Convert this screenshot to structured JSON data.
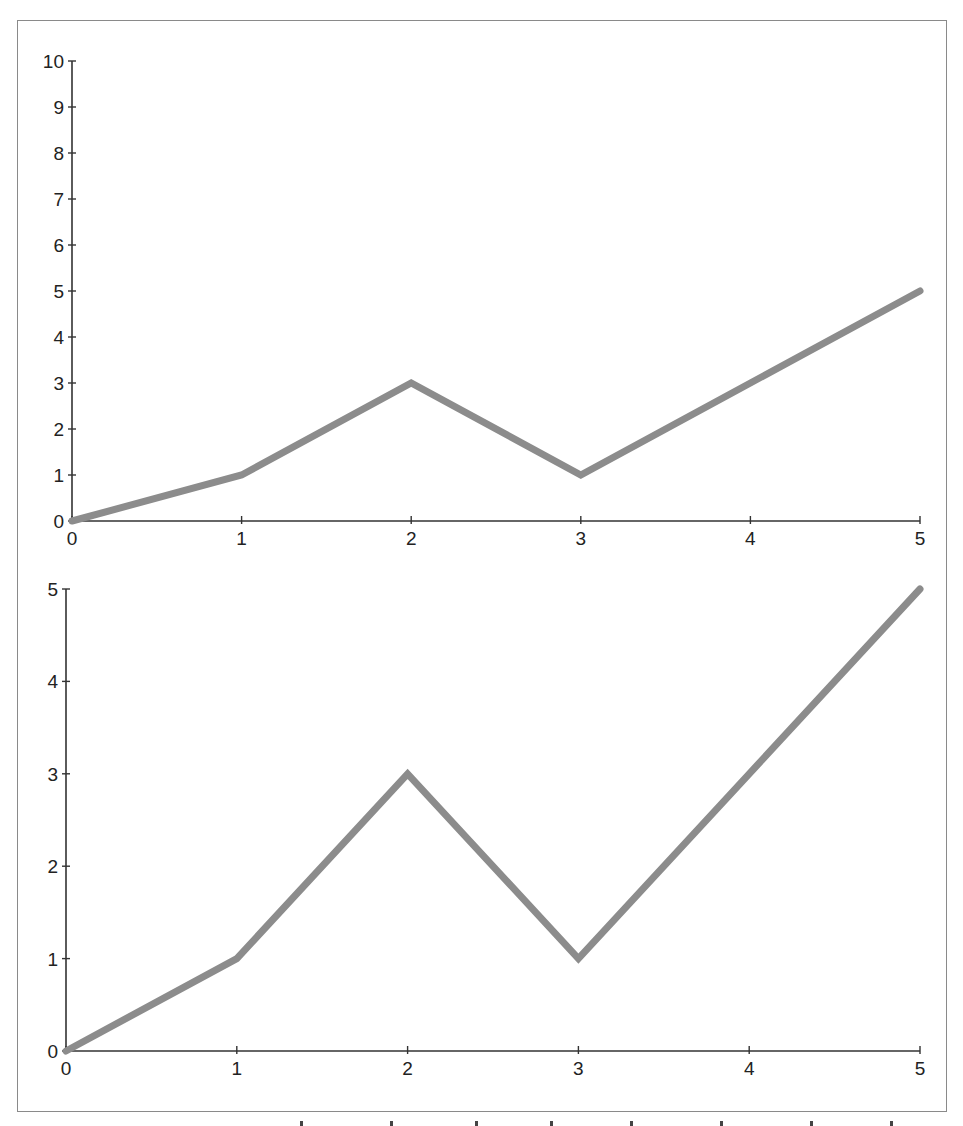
{
  "chart_data": [
    {
      "type": "line",
      "title": "",
      "xlabel": "",
      "ylabel": "",
      "x": [
        0,
        1,
        2,
        3,
        4,
        5
      ],
      "series": [
        {
          "name": "",
          "values": [
            0,
            1,
            3,
            1,
            3,
            5
          ]
        }
      ],
      "xlim": [
        0,
        5
      ],
      "ylim": [
        0,
        10
      ],
      "xticks": [
        "0",
        "1",
        "2",
        "3",
        "4",
        "5"
      ],
      "yticks": [
        "0",
        "1",
        "2",
        "3",
        "4",
        "5",
        "6",
        "7",
        "8",
        "9",
        "10"
      ],
      "grid": false,
      "line_color": "#8c8c8c"
    },
    {
      "type": "line",
      "title": "",
      "xlabel": "",
      "ylabel": "",
      "x": [
        0,
        1,
        2,
        3,
        4,
        5
      ],
      "series": [
        {
          "name": "",
          "values": [
            0,
            1,
            3,
            1,
            3,
            5
          ]
        }
      ],
      "xlim": [
        0,
        5
      ],
      "ylim": [
        0,
        5
      ],
      "xticks": [
        "0",
        "1",
        "2",
        "3",
        "4",
        "5"
      ],
      "yticks": [
        "0",
        "1",
        "2",
        "3",
        "4",
        "5"
      ],
      "grid": false,
      "line_color": "#8c8c8c"
    }
  ]
}
